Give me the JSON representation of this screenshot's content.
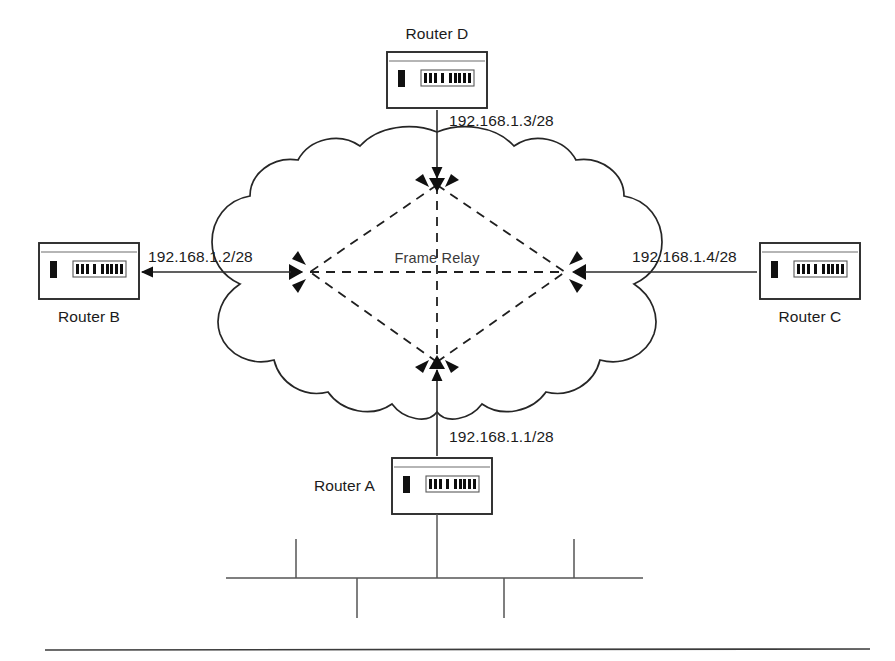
{
  "diagram": {
    "cloud": {
      "label": "Frame Relay",
      "center_x": 437,
      "center_y": 272
    },
    "routers": [
      {
        "id": "router-d",
        "label": "Router D",
        "label_position": "above",
        "position": "top",
        "x": 387,
        "y": 52,
        "width": 100,
        "height": 56
      },
      {
        "id": "router-b",
        "label": "Router B",
        "label_position": "below",
        "position": "left",
        "x": 39,
        "y": 243,
        "width": 100,
        "height": 56
      },
      {
        "id": "router-c",
        "label": "Router C",
        "label_position": "below",
        "position": "right",
        "x": 760,
        "y": 243,
        "width": 100,
        "height": 56
      },
      {
        "id": "router-a",
        "label": "Router A",
        "label_position": "left",
        "position": "bottom",
        "x": 392,
        "y": 458,
        "width": 100,
        "height": 56
      }
    ],
    "links": [
      {
        "id": "link-router-d",
        "ip": "192.168.1.3/28",
        "router": "Router D",
        "orientation": "vertical",
        "label_x": 449,
        "label_y": 126
      },
      {
        "id": "link-router-b",
        "ip": "192.168.1.2/28",
        "router": "Router B",
        "orientation": "horizontal",
        "label_x": 148,
        "label_y": 262
      },
      {
        "id": "link-router-c",
        "ip": "192.168.1.4/28",
        "router": "Router C",
        "orientation": "horizontal",
        "label_x": 632,
        "label_y": 262
      },
      {
        "id": "link-router-a",
        "ip": "192.168.1.1/28",
        "router": "Router A",
        "orientation": "vertical",
        "label_x": 449,
        "label_y": 442
      }
    ],
    "pvc_endpoints": [
      {
        "id": "pvc-node-top",
        "x": 437,
        "y": 185
      },
      {
        "id": "pvc-node-left",
        "x": 310,
        "y": 272
      },
      {
        "id": "pvc-node-right",
        "x": 565,
        "y": 272
      },
      {
        "id": "pvc-node-bottom",
        "x": 437,
        "y": 362
      }
    ],
    "pvc_links": [
      {
        "id": "pvc-top-left",
        "from": "pvc-node-top",
        "to": "pvc-node-left"
      },
      {
        "id": "pvc-top-right",
        "from": "pvc-node-top",
        "to": "pvc-node-right"
      },
      {
        "id": "pvc-bottom-left",
        "from": "pvc-node-bottom",
        "to": "pvc-node-left"
      },
      {
        "id": "pvc-bottom-right",
        "from": "pvc-node-bottom",
        "to": "pvc-node-right"
      },
      {
        "id": "pvc-left-right",
        "from": "pvc-node-left",
        "to": "pvc-node-right"
      },
      {
        "id": "pvc-top-bottom",
        "from": "pvc-node-top",
        "to": "pvc-node-bottom"
      }
    ],
    "lan_segment": {
      "id": "ethernet-bus",
      "bus_y": 578,
      "bus_x1": 226,
      "bus_x2": 643,
      "drop_from_router_x": 437,
      "drop_from_router_y1": 514,
      "taps_up": [
        296,
        574
      ],
      "taps_down": [
        357,
        504
      ]
    },
    "footer_rule": {
      "id": "page-rule",
      "x1": 45,
      "x2": 870,
      "y": 650
    },
    "colors": {
      "line": "#2b2b2b",
      "dashed_pvc": "#1f1f1f",
      "text": "#1b1b1b",
      "cloud_label": "#3a3a3a",
      "background": "#ffffff",
      "bus": "#555555"
    }
  }
}
